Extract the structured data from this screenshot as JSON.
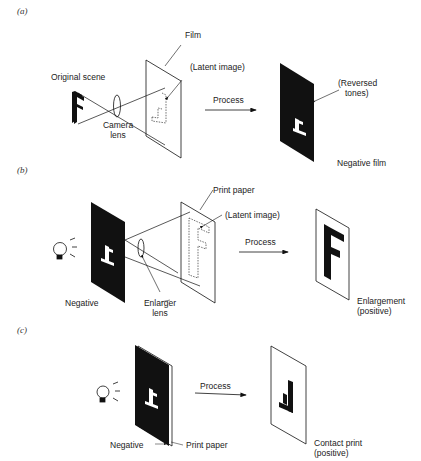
{
  "panels": [
    {
      "id": "a",
      "label": "(a)",
      "labels": {
        "original_scene": "Original scene",
        "camera_lens_1": "Camera",
        "camera_lens_2": "lens",
        "film": "Film",
        "latent_image": "(Latent image)",
        "process": "Process",
        "reversed_1": "(Reversed",
        "reversed_2": "tones)",
        "result": "Negative film"
      }
    },
    {
      "id": "b",
      "label": "(b)",
      "labels": {
        "negative": "Negative",
        "enlarger_lens_1": "Enlarger",
        "enlarger_lens_2": "lens",
        "print_paper": "Print paper",
        "latent_image": "(Latent image)",
        "process": "Process",
        "result_1": "Enlargement",
        "result_2": "(positive)"
      }
    },
    {
      "id": "c",
      "label": "(c)",
      "labels": {
        "negative": "Negative",
        "print_paper": "Print paper",
        "process": "Process",
        "result_1": "Contact print",
        "result_2": "(positive)"
      }
    }
  ],
  "colors": {
    "ink": "#111111",
    "background": "#ffffff"
  }
}
